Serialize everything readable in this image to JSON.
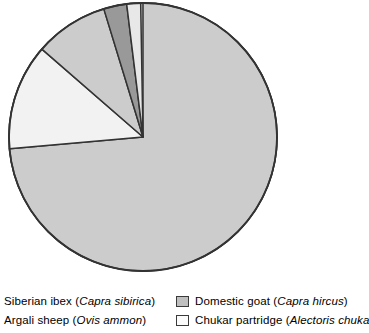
{
  "chart_data": {
    "type": "pie",
    "title": "",
    "subtitle": "",
    "xlabel": "",
    "ylabel": "",
    "grid": false,
    "legend_position": "bottom",
    "start_angle_deg": 0,
    "direction": "clockwise",
    "center": {
      "x": 143,
      "y": 137
    },
    "radius": 134,
    "categories": [
      "Domestic goat (Capra hircus)",
      "Chukar partridge (Alectoris chukar)",
      "Siberian ibex (Capra sibirica)",
      "Argali sheep (Ovis ammon)"
    ],
    "values": [
      73.6,
      12.8,
      2.5,
      1.4
    ],
    "units": "percent",
    "slices": [
      {
        "label": "Domestic goat (Capra hircus)",
        "percent": 73.6,
        "start_deg": 0,
        "end_deg": 265,
        "color": "#cccccc",
        "stroke": "#333333"
      },
      {
        "label": "Chukar partridge (Alectoris chukar)",
        "percent": 12.8,
        "start_deg": 265,
        "end_deg": 311,
        "color": "#f2f2f2",
        "stroke": "#333333"
      },
      {
        "label": "Siberian ibex (Capra sibirica)",
        "percent": 11.7,
        "start_deg": 311,
        "end_deg": 343,
        "color": "#cccccc",
        "stroke": "#333333"
      },
      {
        "label": "Argali sheep (Ovis ammon)",
        "percent": 2.5,
        "start_deg": 343,
        "end_deg": 353,
        "color": "#999999",
        "stroke": "#333333"
      },
      {
        "label": "Chukar partridge (Alectoris chukar)",
        "percent": 1.4,
        "start_deg": 353,
        "end_deg": 359,
        "color": "#e8e8e8",
        "stroke": "#333333"
      }
    ]
  },
  "legend": {
    "left_column": [
      {
        "name_common": "Siberian ibex",
        "name_latin": "Capra sibirica",
        "text_prefix": "Siberian ibex (",
        "text_italic": "Capra sibirica",
        "text_suffix": ")",
        "swatch_color": "#cccccc",
        "swatch_visible": false
      },
      {
        "name_common": "Argali sheep",
        "name_latin": "Ovis ammon",
        "text_prefix": "Argali sheep (",
        "text_italic": "Ovis ammon",
        "text_suffix": ")",
        "swatch_color": "#999999",
        "swatch_visible": false
      }
    ],
    "right_column": [
      {
        "name_common": "Domestic goat",
        "name_latin": "Capra hircus",
        "text_prefix": "Domestic goat (",
        "text_italic": "Capra hircus",
        "text_suffix": ")",
        "swatch_color": "#bfbfbf",
        "swatch_visible": true
      },
      {
        "name_common": "Chukar partridge",
        "name_latin": "Alectoris chuka",
        "text_prefix": "Chukar partridge (",
        "text_italic": "Alectoris chuka",
        "text_suffix": "",
        "swatch_color": "#fbfbfb",
        "swatch_visible": true
      }
    ]
  },
  "colors": {
    "background": "#ffffff",
    "outline": "#333333",
    "slice_light": "#cccccc",
    "slice_white": "#f2f2f2",
    "slice_dark": "#999999",
    "text": "#000000"
  }
}
